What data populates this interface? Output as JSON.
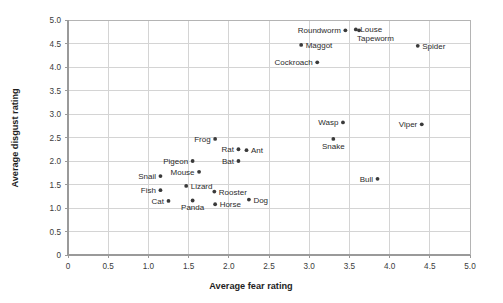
{
  "chart_data": {
    "type": "scatter",
    "title": "",
    "xlabel": "Average fear rating",
    "ylabel": "Average disgust rating",
    "xlim": [
      0,
      5
    ],
    "ylim": [
      0,
      5
    ],
    "xticks": [
      "0",
      "0.5",
      "1.0",
      "1.5",
      "2.0",
      "2.5",
      "3.0",
      "3.5",
      "4.0",
      "4.5",
      "5.0"
    ],
    "yticks": [
      "0",
      "0.5",
      "1.0",
      "1.5",
      "2.0",
      "2.5",
      "3.0",
      "3.5",
      "4.0",
      "4.5",
      "5.0"
    ],
    "xtick_values": [
      0,
      0.5,
      1.0,
      1.5,
      2.0,
      2.5,
      3.0,
      3.5,
      4.0,
      4.5,
      5.0
    ],
    "ytick_values": [
      0,
      0.5,
      1.0,
      1.5,
      2.0,
      2.5,
      3.0,
      3.5,
      4.0,
      4.5,
      5.0
    ],
    "grid": true,
    "legend": "none",
    "marker_color": "#3a3a3a",
    "grid_color": "#d4d4d4",
    "axis_color": "#9a9a9a",
    "points": [
      {
        "label": "Roundworm",
        "x": 3.45,
        "y": 4.78,
        "label_pos": "left"
      },
      {
        "label": "Louse",
        "x": 3.58,
        "y": 4.8,
        "label_pos": "right"
      },
      {
        "label": "Tapeworm",
        "x": 3.62,
        "y": 4.78,
        "label_pos": "below-right"
      },
      {
        "label": "Maggot",
        "x": 2.9,
        "y": 4.47,
        "label_pos": "right"
      },
      {
        "label": "Spider",
        "x": 4.35,
        "y": 4.45,
        "label_pos": "right"
      },
      {
        "label": "Cockroach",
        "x": 3.1,
        "y": 4.1,
        "label_pos": "left"
      },
      {
        "label": "Wasp",
        "x": 3.42,
        "y": 2.82,
        "label_pos": "left"
      },
      {
        "label": "Viper",
        "x": 4.4,
        "y": 2.78,
        "label_pos": "left"
      },
      {
        "label": "Snake",
        "x": 3.3,
        "y": 2.47,
        "label_pos": "below"
      },
      {
        "label": "Frog",
        "x": 1.83,
        "y": 2.47,
        "label_pos": "left"
      },
      {
        "label": "Rat",
        "x": 2.12,
        "y": 2.25,
        "label_pos": "left"
      },
      {
        "label": "Ant",
        "x": 2.22,
        "y": 2.23,
        "label_pos": "right"
      },
      {
        "label": "Bat",
        "x": 2.12,
        "y": 2.0,
        "label_pos": "left"
      },
      {
        "label": "Pigeon",
        "x": 1.55,
        "y": 2.0,
        "label_pos": "left"
      },
      {
        "label": "Mouse",
        "x": 1.63,
        "y": 1.77,
        "label_pos": "left"
      },
      {
        "label": "Snail",
        "x": 1.15,
        "y": 1.68,
        "label_pos": "left"
      },
      {
        "label": "Bull",
        "x": 3.85,
        "y": 1.62,
        "label_pos": "left"
      },
      {
        "label": "Lizard",
        "x": 1.47,
        "y": 1.47,
        "label_pos": "right"
      },
      {
        "label": "Fish",
        "x": 1.15,
        "y": 1.38,
        "label_pos": "left"
      },
      {
        "label": "Rooster",
        "x": 1.82,
        "y": 1.35,
        "label_pos": "right"
      },
      {
        "label": "Cat",
        "x": 1.25,
        "y": 1.15,
        "label_pos": "left"
      },
      {
        "label": "Panda",
        "x": 1.55,
        "y": 1.16,
        "label_pos": "below"
      },
      {
        "label": "Horse",
        "x": 1.83,
        "y": 1.08,
        "label_pos": "right"
      },
      {
        "label": "Dog",
        "x": 2.25,
        "y": 1.18,
        "label_pos": "right"
      }
    ]
  }
}
